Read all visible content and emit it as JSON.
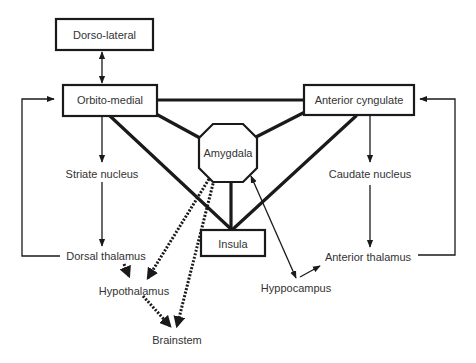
{
  "diagram": {
    "type": "neural-circuit-flow-diagram",
    "nodes": {
      "dorso_lateral": "Dorso-lateral",
      "orbito_medial": "Orbito-medial",
      "anterior_cyngulate": "Anterior cyngulate",
      "amygdala": "Amygdala",
      "insula": "Insula",
      "striate_nucleus": "Striate nucleus",
      "caudate_nucleus": "Caudate nucleus",
      "dorsal_thalamus": "Dorsal thalamus",
      "anterior_thalamus": "Anterior thalamus",
      "hypothalamus": "Hypothalamus",
      "hyppocampus": "Hyppocampus",
      "brainstem": "Brainstem"
    },
    "edges": [
      {
        "from": "Dorso-lateral",
        "to": "Orbito-medial",
        "style": "thin",
        "arrow": "both"
      },
      {
        "from": "Orbito-medial",
        "to": "Anterior cyngulate",
        "style": "thick",
        "arrow": "none"
      },
      {
        "from": "Orbito-medial",
        "to": "Amygdala",
        "style": "thick",
        "arrow": "none"
      },
      {
        "from": "Orbito-medial",
        "to": "Insula",
        "style": "thick",
        "arrow": "none"
      },
      {
        "from": "Anterior cyngulate",
        "to": "Amygdala",
        "style": "thick",
        "arrow": "none"
      },
      {
        "from": "Anterior cyngulate",
        "to": "Insula",
        "style": "thick",
        "arrow": "none"
      },
      {
        "from": "Amygdala",
        "to": "Insula",
        "style": "thick",
        "arrow": "none"
      },
      {
        "from": "Orbito-medial",
        "to": "Striate nucleus",
        "style": "thin",
        "arrow": "end"
      },
      {
        "from": "Striate nucleus",
        "to": "Dorsal thalamus",
        "style": "thin",
        "arrow": "end"
      },
      {
        "from": "Dorsal thalamus",
        "to": "Orbito-medial",
        "style": "thin",
        "arrow": "end"
      },
      {
        "from": "Anterior cyngulate",
        "to": "Caudate nucleus",
        "style": "thin",
        "arrow": "end"
      },
      {
        "from": "Caudate nucleus",
        "to": "Anterior thalamus",
        "style": "thin",
        "arrow": "end"
      },
      {
        "from": "Anterior thalamus",
        "to": "Anterior cyngulate",
        "style": "thin",
        "arrow": "end"
      },
      {
        "from": "Amygdala",
        "to": "Hyppocampus",
        "style": "thin",
        "arrow": "both"
      },
      {
        "from": "Hyppocampus",
        "to": "Anterior thalamus",
        "style": "thin",
        "arrow": "end"
      },
      {
        "from": "Dorsal thalamus",
        "to": "Hypothalamus",
        "style": "dotted",
        "arrow": "end"
      },
      {
        "from": "Amygdala",
        "to": "Hypothalamus",
        "style": "dotted",
        "arrow": "end"
      },
      {
        "from": "Amygdala",
        "to": "Brainstem",
        "style": "dotted",
        "arrow": "end"
      },
      {
        "from": "Hypothalamus",
        "to": "Brainstem",
        "style": "dotted",
        "arrow": "end"
      }
    ]
  }
}
